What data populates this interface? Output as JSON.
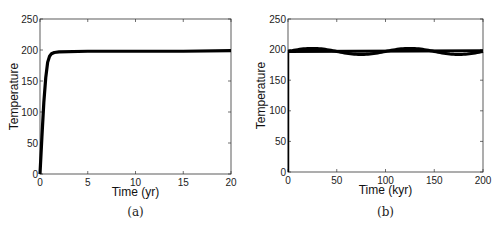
{
  "chart_data": [
    {
      "panel": "(a)",
      "type": "line",
      "xlabel": "Time (yr)",
      "ylabel": "Temperature",
      "xlim": [
        0,
        20
      ],
      "ylim": [
        0,
        250
      ],
      "xticks": [
        0,
        5,
        10,
        15,
        20
      ],
      "yticks": [
        0,
        50,
        100,
        150,
        200,
        250
      ],
      "grid": false,
      "series": [
        {
          "name": "temperature",
          "x": [
            0,
            0.2,
            0.4,
            0.6,
            0.8,
            1.0,
            1.2,
            1.5,
            2,
            5,
            10,
            15,
            20
          ],
          "values": [
            0,
            60,
            115,
            155,
            180,
            190,
            194,
            196,
            197,
            198,
            198,
            198,
            199
          ]
        }
      ]
    },
    {
      "panel": "(b)",
      "type": "line",
      "xlabel": "Time (kyr)",
      "ylabel": "Temperature",
      "xlim": [
        0,
        200
      ],
      "ylim": [
        0,
        250
      ],
      "xticks": [
        0,
        50,
        100,
        150,
        200
      ],
      "yticks": [
        0,
        50,
        100,
        150,
        200,
        250
      ],
      "grid": false,
      "series": [
        {
          "name": "oscillating",
          "x": [
            0,
            25,
            50,
            75,
            100,
            125,
            150,
            175,
            200
          ],
          "values": [
            197,
            202,
            197,
            192,
            197,
            202,
            197,
            192,
            197
          ]
        },
        {
          "name": "mean",
          "x": [
            0,
            200
          ],
          "values": [
            197,
            198
          ]
        }
      ]
    }
  ],
  "captions": {
    "a": "(a)",
    "b": "(b)"
  }
}
